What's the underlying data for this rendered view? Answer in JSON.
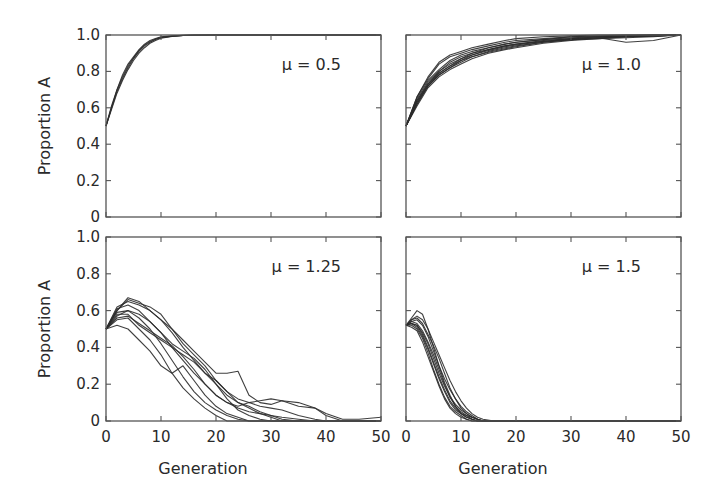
{
  "figure": {
    "ylabel": "Proportion A",
    "xlabel": "Generation"
  },
  "chart_data": [
    {
      "type": "line",
      "panel": "top-left",
      "annotation": "μ = 0.5",
      "xlabel": "",
      "ylabel": "Proportion A",
      "xlim": [
        0,
        50
      ],
      "ylim": [
        0,
        1.0
      ],
      "xticks": [
        0,
        10,
        20,
        30,
        40,
        50
      ],
      "yticks": [
        0,
        0.2,
        0.4,
        0.6,
        0.8,
        1.0
      ],
      "ytick_labels": [
        "0",
        "0.2",
        "0.4",
        "0.6",
        "0.8",
        "1.0"
      ],
      "xtick_labels_shown": false,
      "grid": false,
      "x": [
        0,
        1,
        2,
        3,
        4,
        5,
        6,
        7,
        8,
        9,
        10,
        12,
        14,
        16,
        20,
        30,
        40,
        50
      ],
      "series": [
        {
          "name": "run-1",
          "values": [
            0.5,
            0.6,
            0.69,
            0.76,
            0.82,
            0.87,
            0.91,
            0.94,
            0.96,
            0.975,
            0.985,
            0.993,
            0.997,
            0.999,
            1.0,
            1.0,
            1.0,
            1.0
          ]
        },
        {
          "name": "run-2",
          "values": [
            0.5,
            0.61,
            0.7,
            0.78,
            0.84,
            0.88,
            0.92,
            0.95,
            0.97,
            0.98,
            0.99,
            0.995,
            0.998,
            1.0,
            1.0,
            1.0,
            1.0,
            1.0
          ]
        },
        {
          "name": "run-3",
          "values": [
            0.5,
            0.59,
            0.68,
            0.75,
            0.81,
            0.86,
            0.9,
            0.93,
            0.955,
            0.97,
            0.982,
            0.992,
            0.997,
            0.999,
            1.0,
            1.0,
            1.0,
            1.0
          ]
        },
        {
          "name": "run-4",
          "values": [
            0.5,
            0.6,
            0.7,
            0.77,
            0.83,
            0.875,
            0.915,
            0.945,
            0.965,
            0.978,
            0.987,
            0.994,
            0.998,
            1.0,
            1.0,
            1.0,
            1.0,
            1.0
          ]
        }
      ]
    },
    {
      "type": "line",
      "panel": "top-right",
      "annotation": "μ = 1.0",
      "xlabel": "",
      "ylabel": "",
      "xlim": [
        0,
        50
      ],
      "ylim": [
        0,
        1.0
      ],
      "xticks": [
        0,
        10,
        20,
        30,
        40,
        50
      ],
      "yticks": [
        0,
        0.2,
        0.4,
        0.6,
        0.8,
        1.0
      ],
      "xtick_labels_shown": false,
      "ytick_labels_shown": false,
      "grid": false,
      "x": [
        0,
        2,
        4,
        6,
        8,
        10,
        12,
        15,
        18,
        20,
        25,
        30,
        35,
        40,
        45,
        50
      ],
      "series": [
        {
          "name": "run-1",
          "values": [
            0.5,
            0.66,
            0.76,
            0.84,
            0.88,
            0.9,
            0.92,
            0.94,
            0.96,
            0.97,
            0.98,
            0.99,
            0.99,
            0.995,
            1.0,
            1.0
          ]
        },
        {
          "name": "run-2",
          "values": [
            0.5,
            0.64,
            0.74,
            0.8,
            0.84,
            0.87,
            0.9,
            0.93,
            0.95,
            0.96,
            0.975,
            0.985,
            0.99,
            0.99,
            0.995,
            1.0
          ]
        },
        {
          "name": "run-3",
          "values": [
            0.5,
            0.62,
            0.72,
            0.78,
            0.82,
            0.86,
            0.89,
            0.92,
            0.94,
            0.95,
            0.97,
            0.98,
            0.985,
            0.96,
            0.97,
            1.0
          ]
        },
        {
          "name": "run-4",
          "values": [
            0.5,
            0.65,
            0.75,
            0.81,
            0.86,
            0.89,
            0.91,
            0.93,
            0.95,
            0.96,
            0.975,
            0.99,
            0.995,
            1.0,
            1.0,
            1.0
          ]
        },
        {
          "name": "run-5",
          "values": [
            0.5,
            0.63,
            0.73,
            0.79,
            0.83,
            0.86,
            0.88,
            0.91,
            0.93,
            0.94,
            0.96,
            0.975,
            0.985,
            0.99,
            0.995,
            1.0
          ]
        },
        {
          "name": "run-6",
          "values": [
            0.5,
            0.61,
            0.71,
            0.77,
            0.81,
            0.84,
            0.87,
            0.9,
            0.92,
            0.93,
            0.955,
            0.97,
            0.98,
            0.99,
            0.995,
            1.0
          ]
        },
        {
          "name": "run-7",
          "values": [
            0.5,
            0.64,
            0.73,
            0.8,
            0.85,
            0.88,
            0.9,
            0.92,
            0.94,
            0.95,
            0.965,
            0.98,
            0.99,
            0.995,
            1.0,
            1.0
          ]
        },
        {
          "name": "run-8",
          "values": [
            0.5,
            0.62,
            0.72,
            0.79,
            0.83,
            0.87,
            0.89,
            0.915,
            0.935,
            0.945,
            0.965,
            0.975,
            0.98,
            0.985,
            0.99,
            1.0
          ]
        },
        {
          "name": "run-9",
          "values": [
            0.5,
            0.66,
            0.77,
            0.85,
            0.89,
            0.91,
            0.93,
            0.95,
            0.97,
            0.98,
            0.99,
            0.995,
            1.0,
            1.0,
            1.0,
            1.0
          ]
        },
        {
          "name": "run-10",
          "values": [
            0.5,
            0.63,
            0.72,
            0.78,
            0.82,
            0.85,
            0.88,
            0.905,
            0.925,
            0.935,
            0.96,
            0.975,
            0.985,
            0.99,
            0.995,
            1.0
          ]
        }
      ]
    },
    {
      "type": "line",
      "panel": "bottom-left",
      "annotation": "μ = 1.25",
      "xlabel": "Generation",
      "ylabel": "Proportion A",
      "xlim": [
        0,
        50
      ],
      "ylim": [
        0,
        1.0
      ],
      "xticks": [
        0,
        10,
        20,
        30,
        40,
        50
      ],
      "xtick_labels": [
        "0",
        "10",
        "20",
        "30",
        "40",
        "50"
      ],
      "yticks": [
        0,
        0.2,
        0.4,
        0.6,
        0.8,
        1.0
      ],
      "ytick_labels": [
        "0",
        "0.2",
        "0.4",
        "0.6",
        "0.8",
        "1.0"
      ],
      "grid": false,
      "x": [
        0,
        2,
        4,
        6,
        8,
        10,
        12,
        14,
        16,
        18,
        20,
        22,
        24,
        26,
        28,
        30,
        32,
        35,
        38,
        40,
        43,
        46,
        50
      ],
      "series": [
        {
          "name": "run-1",
          "values": [
            0.5,
            0.6,
            0.67,
            0.65,
            0.6,
            0.55,
            0.5,
            0.44,
            0.38,
            0.32,
            0.26,
            0.26,
            0.27,
            0.14,
            0.1,
            0.09,
            0.11,
            0.1,
            0.07,
            0.04,
            0.01,
            0.01,
            0.02
          ]
        },
        {
          "name": "run-2",
          "values": [
            0.5,
            0.57,
            0.6,
            0.58,
            0.54,
            0.48,
            0.4,
            0.33,
            0.26,
            0.2,
            0.14,
            0.1,
            0.08,
            0.1,
            0.11,
            0.12,
            0.11,
            0.08,
            0.07,
            0.03,
            0.0,
            0.0,
            0.0
          ]
        },
        {
          "name": "run-3",
          "values": [
            0.5,
            0.52,
            0.5,
            0.44,
            0.38,
            0.3,
            0.26,
            0.3,
            0.22,
            0.14,
            0.08,
            0.04,
            0.02,
            0.0,
            0.0,
            0.0,
            0.0,
            0.0,
            0.0,
            0.0,
            0.0,
            0.0,
            0.0
          ]
        },
        {
          "name": "run-4",
          "values": [
            0.5,
            0.62,
            0.65,
            0.63,
            0.6,
            0.55,
            0.48,
            0.4,
            0.33,
            0.26,
            0.22,
            0.16,
            0.1,
            0.07,
            0.04,
            0.02,
            0.0,
            0.0,
            0.0,
            0.0,
            0.0,
            0.0,
            0.0
          ]
        },
        {
          "name": "run-5",
          "values": [
            0.5,
            0.58,
            0.58,
            0.52,
            0.48,
            0.44,
            0.4,
            0.36,
            0.32,
            0.26,
            0.2,
            0.14,
            0.1,
            0.08,
            0.05,
            0.03,
            0.01,
            0.0,
            0.0,
            0.0,
            0.0,
            0.0,
            0.0
          ]
        },
        {
          "name": "run-6",
          "values": [
            0.5,
            0.6,
            0.66,
            0.64,
            0.62,
            0.58,
            0.5,
            0.42,
            0.36,
            0.3,
            0.22,
            0.16,
            0.12,
            0.1,
            0.08,
            0.07,
            0.06,
            0.03,
            0.01,
            0.0,
            0.0,
            0.0,
            0.0
          ]
        },
        {
          "name": "run-7",
          "values": [
            0.5,
            0.55,
            0.56,
            0.5,
            0.44,
            0.36,
            0.26,
            0.18,
            0.12,
            0.07,
            0.03,
            0.0,
            0.0,
            0.0,
            0.0,
            0.0,
            0.0,
            0.0,
            0.0,
            0.0,
            0.0,
            0.0,
            0.0
          ]
        },
        {
          "name": "run-8",
          "values": [
            0.5,
            0.59,
            0.6,
            0.56,
            0.5,
            0.42,
            0.33,
            0.24,
            0.16,
            0.1,
            0.06,
            0.03,
            0.01,
            0.0,
            0.0,
            0.0,
            0.0,
            0.0,
            0.0,
            0.0,
            0.0,
            0.0,
            0.0
          ]
        },
        {
          "name": "run-9",
          "values": [
            0.5,
            0.61,
            0.63,
            0.6,
            0.54,
            0.48,
            0.42,
            0.38,
            0.34,
            0.28,
            0.2,
            0.12,
            0.06,
            0.03,
            0.01,
            0.0,
            0.0,
            0.0,
            0.0,
            0.0,
            0.0,
            0.0,
            0.0
          ]
        },
        {
          "name": "run-10",
          "values": [
            0.5,
            0.56,
            0.57,
            0.53,
            0.49,
            0.45,
            0.41,
            0.35,
            0.28,
            0.2,
            0.14,
            0.1,
            0.07,
            0.05,
            0.04,
            0.03,
            0.02,
            0.01,
            0.0,
            0.0,
            0.0,
            0.0,
            0.0
          ]
        }
      ]
    },
    {
      "type": "line",
      "panel": "bottom-right",
      "annotation": "μ = 1.5",
      "xlabel": "Generation",
      "ylabel": "",
      "xlim": [
        0,
        50
      ],
      "ylim": [
        0,
        1.0
      ],
      "xticks": [
        0,
        10,
        20,
        30,
        40,
        50
      ],
      "xtick_labels": [
        "0",
        "10",
        "20",
        "30",
        "40",
        "50"
      ],
      "yticks": [
        0,
        0.2,
        0.4,
        0.6,
        0.8,
        1.0
      ],
      "ytick_labels_shown": false,
      "grid": false,
      "x": [
        0,
        1,
        2,
        3,
        4,
        5,
        6,
        7,
        8,
        9,
        10,
        11,
        12,
        13,
        14,
        16,
        20,
        30,
        40,
        50
      ],
      "series": [
        {
          "name": "run-1",
          "values": [
            0.52,
            0.56,
            0.6,
            0.58,
            0.5,
            0.4,
            0.3,
            0.21,
            0.14,
            0.08,
            0.04,
            0.02,
            0.01,
            0.0,
            0.0,
            0.0,
            0.0,
            0.0,
            0.0,
            0.0
          ]
        },
        {
          "name": "run-2",
          "values": [
            0.52,
            0.54,
            0.55,
            0.52,
            0.46,
            0.38,
            0.3,
            0.23,
            0.17,
            0.12,
            0.08,
            0.05,
            0.03,
            0.01,
            0.0,
            0.0,
            0.0,
            0.0,
            0.0,
            0.0
          ]
        },
        {
          "name": "run-3",
          "values": [
            0.52,
            0.53,
            0.52,
            0.47,
            0.4,
            0.32,
            0.24,
            0.17,
            0.11,
            0.07,
            0.04,
            0.02,
            0.01,
            0.0,
            0.0,
            0.0,
            0.0,
            0.0,
            0.0,
            0.0
          ]
        },
        {
          "name": "run-4",
          "values": [
            0.52,
            0.55,
            0.57,
            0.55,
            0.5,
            0.43,
            0.36,
            0.29,
            0.22,
            0.16,
            0.11,
            0.07,
            0.04,
            0.02,
            0.01,
            0.0,
            0.0,
            0.0,
            0.0,
            0.0
          ]
        },
        {
          "name": "run-5",
          "values": [
            0.52,
            0.52,
            0.5,
            0.45,
            0.37,
            0.28,
            0.2,
            0.13,
            0.08,
            0.05,
            0.03,
            0.01,
            0.0,
            0.0,
            0.0,
            0.0,
            0.0,
            0.0,
            0.0,
            0.0
          ]
        },
        {
          "name": "run-6",
          "values": [
            0.52,
            0.53,
            0.51,
            0.46,
            0.39,
            0.31,
            0.23,
            0.16,
            0.1,
            0.06,
            0.04,
            0.03,
            0.02,
            0.01,
            0.0,
            0.0,
            0.0,
            0.0,
            0.0,
            0.0
          ]
        },
        {
          "name": "run-7",
          "values": [
            0.52,
            0.54,
            0.53,
            0.49,
            0.43,
            0.36,
            0.28,
            0.2,
            0.13,
            0.08,
            0.05,
            0.03,
            0.01,
            0.0,
            0.0,
            0.0,
            0.0,
            0.0,
            0.0,
            0.0
          ]
        },
        {
          "name": "run-8",
          "values": [
            0.52,
            0.51,
            0.49,
            0.43,
            0.35,
            0.27,
            0.19,
            0.12,
            0.07,
            0.04,
            0.02,
            0.01,
            0.0,
            0.0,
            0.0,
            0.0,
            0.0,
            0.0,
            0.0,
            0.0
          ]
        },
        {
          "name": "run-9",
          "values": [
            0.52,
            0.55,
            0.56,
            0.53,
            0.47,
            0.41,
            0.34,
            0.26,
            0.18,
            0.12,
            0.07,
            0.04,
            0.02,
            0.01,
            0.0,
            0.0,
            0.0,
            0.0,
            0.0,
            0.0
          ]
        },
        {
          "name": "run-10",
          "values": [
            0.52,
            0.53,
            0.52,
            0.48,
            0.42,
            0.34,
            0.26,
            0.19,
            0.13,
            0.09,
            0.06,
            0.04,
            0.02,
            0.01,
            0.0,
            0.0,
            0.0,
            0.0,
            0.0,
            0.0
          ]
        }
      ]
    }
  ]
}
